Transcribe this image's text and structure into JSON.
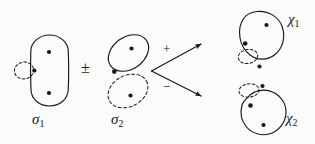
{
  "figure": {
    "kind": "diagram",
    "background_color": "#fbfbfa",
    "ink_color": "#17171a",
    "labels": {
      "sigma1": "σ",
      "sigma1_sub": "1",
      "sigma2": "σ",
      "sigma2_sub": "2",
      "chi1": "χ",
      "chi1_sub": "1",
      "chi2": "χ",
      "chi2_sub": "2",
      "plus_minus": "±",
      "branch_plus": "+",
      "branch_minus": "−"
    },
    "shapes": [
      {
        "id": "sigma1",
        "label": "σ1",
        "outline": "solid",
        "form": "vertical-stadium",
        "dots": 3,
        "dashed_circles": 1,
        "dashed_circle_position": "left-edge"
      },
      {
        "id": "sigma2",
        "label": "σ2",
        "outline": "solid-top-dashed-bottom",
        "form": "two-tilted-ovals",
        "dots": 3,
        "dashed_circles": 1,
        "dashed_circle_position": "lower-oval"
      },
      {
        "id": "chi1",
        "label": "χ1",
        "outline": "solid",
        "form": "irregular-blob",
        "dots": 3,
        "dashed_circles": 1,
        "dashed_circle_position": "lower-left"
      },
      {
        "id": "chi2",
        "label": "χ2",
        "outline": "solid",
        "form": "irregular-blob",
        "dots": 3,
        "dashed_circles": 1,
        "dashed_circle_position": "upper-left"
      }
    ],
    "arrows": [
      {
        "id": "arrow-plus",
        "sign": "+",
        "direction": "up-right",
        "target": "χ1"
      },
      {
        "id": "arrow-minus",
        "sign": "−",
        "direction": "down-right",
        "target": "χ2"
      }
    ]
  }
}
